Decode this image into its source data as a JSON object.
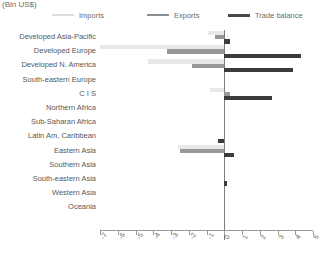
{
  "title": "(Bln US$)",
  "legend": {
    "position": "top",
    "items": [
      {
        "label": "Imports",
        "color": "#e8e8e8",
        "name": "imports"
      },
      {
        "label": "Exports",
        "color": "#989898",
        "name": "exports"
      },
      {
        "label": "Trade balance",
        "color": "#3b3b3d",
        "name": "trade-balance"
      }
    ]
  },
  "chart_data": {
    "type": "bar",
    "orientation": "horizontal",
    "title": "(Bln US$)",
    "xlabel": "",
    "ylabel": "",
    "xlim": [
      -7,
      5
    ],
    "grid": false,
    "legend_position": "top",
    "xticks": [
      -7,
      -6,
      -5,
      -4,
      -3,
      -2,
      -1,
      0,
      1,
      2,
      3,
      4,
      5
    ],
    "xticklabels": [
      "-7",
      "-6",
      "-5",
      "-4",
      "-3",
      "-2",
      "-1",
      "0",
      "1",
      "2",
      "3",
      "4",
      "5"
    ],
    "categories": [
      "Developed Asia-Pacific",
      "Developed Europe",
      "Developed N. America",
      "South-eastern Europe",
      "C I S",
      "Northern Africa",
      "Sub-Saharan Africa",
      "Latin Am, Caribbean",
      "Eastern Asia",
      "Southern Asia",
      "South-eastern Asia",
      "Western Asia",
      "Oceania"
    ],
    "series": [
      {
        "name": "Imports",
        "color": "#e8e8e8",
        "values": [
          -0.9,
          -7.0,
          -4.3,
          0.0,
          -0.8,
          0.0,
          0.0,
          0.0,
          -2.6,
          0.0,
          0.0,
          0.0,
          0.0
        ]
      },
      {
        "name": "Exports",
        "color": "#989898",
        "values": [
          -0.5,
          -3.2,
          -1.8,
          0.0,
          0.3,
          0.0,
          0.0,
          0.0,
          -2.5,
          0.0,
          0.0,
          0.0,
          0.0
        ]
      },
      {
        "name": "Trade balance",
        "color": "#3b3b3d",
        "values": [
          0.35,
          4.3,
          3.9,
          0.0,
          2.7,
          0.0,
          0.0,
          -0.35,
          0.55,
          0.0,
          0.15,
          0.0,
          0.0
        ]
      }
    ]
  }
}
